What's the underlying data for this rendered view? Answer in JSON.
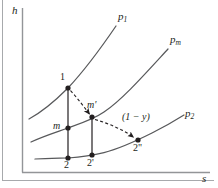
{
  "figure": {
    "axes": {
      "y_label": "h",
      "x_label": "s",
      "y_axis_name": "enthalpy",
      "x_axis_name": "entropy",
      "grid": "off"
    },
    "curves": [
      {
        "id": "p1",
        "label_main": "p",
        "label_sub": "1",
        "role": "high-pressure constant-pressure line"
      },
      {
        "id": "pm",
        "label_main": "p",
        "label_sub": "m",
        "role": "intermediate-pressure constant-pressure line"
      },
      {
        "id": "p2",
        "label_main": "p",
        "label_sub": "2",
        "role": "low-pressure constant-pressure line"
      }
    ],
    "points": [
      {
        "id": "1",
        "label": "1",
        "x": 68,
        "y": 88,
        "on_curve": "p1"
      },
      {
        "id": "m",
        "label": "m",
        "x": 68,
        "y": 128,
        "on_curve": "pm"
      },
      {
        "id": "2",
        "label": "2",
        "x": 68,
        "y": 158,
        "on_curve": "p2"
      },
      {
        "id": "mp",
        "label": "m'",
        "x": 92,
        "y": 117,
        "on_curve": "pm"
      },
      {
        "id": "2p",
        "label": "2'",
        "x": 92,
        "y": 155,
        "on_curve": "p2"
      },
      {
        "id": "2pp",
        "label": "2\"",
        "x": 138,
        "y": 140,
        "on_curve": "p2"
      }
    ],
    "annotations": [
      {
        "id": "fraction",
        "text": "(1 − y)",
        "describes": "remaining steam fraction after extraction, on dashed path m' to 2\""
      }
    ],
    "colors": {
      "line": "#231f20",
      "curve": "#58595b",
      "axis": "#939598",
      "frame": "#a7a9ac",
      "text": "#231f20",
      "background": "#ffffff"
    }
  }
}
